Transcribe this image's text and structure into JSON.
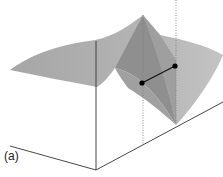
{
  "figure": {
    "label": "(a)",
    "colors": {
      "surface_light": "#bdbdbd",
      "surface_mid": "#a8a8a8",
      "surface_dark": "#8f8f8f",
      "axis": "#333333",
      "point": "#000000",
      "dotted": "#777777"
    },
    "markers": [
      {
        "name": "point-a"
      },
      {
        "name": "point-b"
      }
    ]
  }
}
